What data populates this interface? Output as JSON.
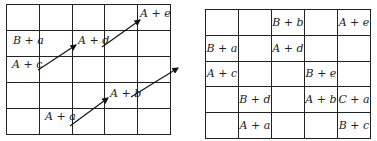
{
  "left_diagram": {
    "rows": 5,
    "cols": 5,
    "cells": [
      [
        "",
        "",
        "",
        "",
        ""
      ],
      [
        "",
        "",
        "",
        "",
        ""
      ],
      [
        "",
        "",
        "",
        "",
        ""
      ],
      [
        "",
        "",
        "",
        "",
        ""
      ],
      [
        "",
        "",
        "",
        "",
        ""
      ]
    ],
    "labels": [
      {
        "text": "A + e",
        "x": 140,
        "y": 7
      },
      {
        "text": "B + a",
        "x": 13,
        "y": 34
      },
      {
        "text": "A + d",
        "x": 78,
        "y": 34
      },
      {
        "text": "A + c",
        "x": 12,
        "y": 58
      },
      {
        "text": "A + b",
        "x": 110,
        "y": 87
      },
      {
        "text": "A + a",
        "x": 45,
        "y": 110
      }
    ],
    "arrows": [
      {
        "from": [
          38,
          70
        ],
        "to": [
          76,
          45
        ]
      },
      {
        "from": [
          102,
          47
        ],
        "to": [
          140,
          20
        ]
      },
      {
        "from": [
          70,
          126
        ],
        "to": [
          108,
          98
        ]
      },
      {
        "from": [
          131,
          97
        ],
        "to": [
          178,
          68
        ]
      }
    ]
  },
  "right_diagram": {
    "rows": 5,
    "cols": 5,
    "cells": [
      [
        "",
        "",
        "B + b",
        "",
        "A + e"
      ],
      [
        "B + a",
        "",
        "A + d",
        "",
        ""
      ],
      [
        "A + c",
        "",
        "",
        "B + e",
        ""
      ],
      [
        "",
        "B + d",
        "",
        "A + b",
        "C + a"
      ],
      [
        "",
        "A + a",
        "",
        "",
        "B + c"
      ]
    ]
  }
}
